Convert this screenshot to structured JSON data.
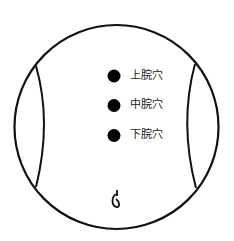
{
  "diagram": {
    "title": "",
    "points": [
      {
        "label": "上脘穴",
        "x": 114,
        "y": 76
      },
      {
        "label": "中脘穴",
        "x": 114,
        "y": 105
      },
      {
        "label": "下脘穴",
        "x": 114,
        "y": 135
      }
    ],
    "navel_symbol": "navel",
    "colors": {
      "stroke": "#111111",
      "dot": "#000000",
      "text": "#222222"
    }
  }
}
